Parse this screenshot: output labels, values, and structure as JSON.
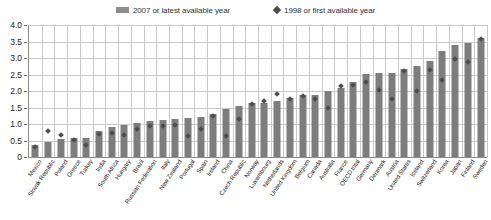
{
  "legend": {
    "items": [
      {
        "label": "2007 or latest available year",
        "marker": "bar-swatch",
        "color": "#8d8d8d"
      },
      {
        "label": "1998 or first available year",
        "marker": "diamond-swatch",
        "color": "#4a4a4a"
      }
    ]
  },
  "chart_data": {
    "type": "bar",
    "title": "",
    "xlabel": "",
    "ylabel": "",
    "ylim": [
      0,
      4.0
    ],
    "ytick_labels": [
      "0",
      "0.5",
      "1.0",
      "1.5",
      "2.0",
      "2.5",
      "3.0",
      "3.5",
      "4.0"
    ],
    "ytick_values": [
      0,
      0.5,
      1.0,
      1.5,
      2.0,
      2.5,
      3.0,
      3.5,
      4.0
    ],
    "grid": true,
    "legend_position": "top-center",
    "categories": [
      "Mexico",
      "Slovak Republic",
      "Poland",
      "Greece",
      "Turkey",
      "India",
      "South Africa",
      "Hungary",
      "Brazil",
      "Russian Federation",
      "Italy",
      "New Zealand",
      "Portugal",
      "Spain",
      "Ireland",
      "China",
      "Czech Republic",
      "Norway",
      "Luxembourg",
      "Netherlands",
      "United Kingdom",
      "Belgium",
      "Canada",
      "Australia",
      "France",
      "OECD total",
      "Germany",
      "Denmark",
      "Austria",
      "United States",
      "Iceland",
      "Switzerland",
      "Korea",
      "Japan",
      "Finland",
      "Sweden"
    ],
    "series": [
      {
        "name": "2007 or latest available year",
        "color": "#7d7d7d",
        "type": "bar",
        "values": [
          0.37,
          0.46,
          0.56,
          0.57,
          0.58,
          0.8,
          0.92,
          0.97,
          1.02,
          1.08,
          1.13,
          1.14,
          1.18,
          1.2,
          1.31,
          1.44,
          1.54,
          1.64,
          1.63,
          1.7,
          1.79,
          1.87,
          1.88,
          2.01,
          2.08,
          2.28,
          2.53,
          2.55,
          2.56,
          2.68,
          2.75,
          2.9,
          3.21,
          3.39,
          3.47,
          3.6
        ]
      },
      {
        "name": "1998 or first available year",
        "color": "#4d4d4d",
        "type": "scatter",
        "marker": "diamond",
        "values": [
          0.31,
          0.78,
          0.67,
          0.51,
          0.37,
          0.71,
          0.73,
          0.67,
          0.86,
          0.95,
          0.94,
          0.97,
          0.65,
          0.86,
          1.23,
          0.65,
          1.15,
          1.61,
          1.71,
          1.9,
          1.76,
          1.86,
          1.76,
          1.5,
          2.14,
          2.17,
          2.27,
          2.04,
          1.77,
          2.6,
          2.0,
          2.63,
          2.34,
          2.98,
          2.88,
          3.58
        ]
      }
    ]
  }
}
